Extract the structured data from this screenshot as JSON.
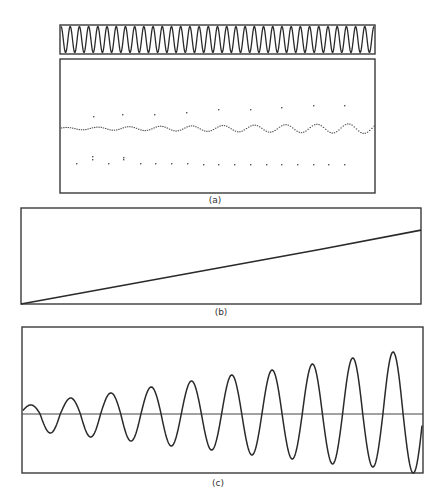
{
  "figure": {
    "panels": [
      {
        "id": "a",
        "label": "(a)"
      },
      {
        "id": "b",
        "label": "(b)"
      },
      {
        "id": "c",
        "label": "(c)"
      }
    ]
  },
  "colors": {
    "background": "#ffffff",
    "ink": "#2a2a2a",
    "frame": "#3a3a3a"
  },
  "chart_data": [
    {
      "panel": "(a) top strip",
      "type": "line",
      "title": "",
      "xlabel": "",
      "ylabel": "",
      "description": "Dense constant-amplitude oscillation filling the strip",
      "cycles": 34,
      "amplitude": "full-scale",
      "grid": false,
      "legend": null
    },
    {
      "panel": "(a) lower",
      "type": "scatter",
      "title": "",
      "xlabel": "",
      "ylabel": "",
      "description": "Dotted waveform near mid-height with slowly growing oscillation, plus sparse sample points above and below",
      "main_trace": {
        "cycles": 10,
        "amplitude_start": 1,
        "amplitude_end": 5,
        "relative_units": "px"
      },
      "upper_points_x": [
        93,
        122,
        154,
        186,
        218,
        250,
        281,
        313,
        344
      ],
      "upper_points_y": [
        116,
        114,
        114,
        112,
        109,
        109,
        107,
        105,
        105
      ],
      "lower_points_x": [
        76,
        92,
        108,
        123,
        140,
        155,
        171,
        187,
        203,
        218,
        234,
        250,
        266,
        281,
        297,
        313,
        328,
        344
      ],
      "lower_points_y": [
        163,
        159,
        163,
        159,
        163,
        163,
        163,
        163,
        164,
        164,
        164,
        164,
        164,
        164,
        164,
        164,
        164,
        164
      ],
      "grid": false,
      "legend": null
    },
    {
      "panel": "(b)",
      "type": "line",
      "title": "",
      "xlabel": "",
      "ylabel": "",
      "description": "Monotonic linear ramp from bottom-left to about 77% height at right",
      "x": [
        0,
        0.25,
        0.5,
        0.75,
        1.0
      ],
      "y": [
        0,
        0.19,
        0.38,
        0.57,
        0.77
      ],
      "xlim": [
        0,
        1
      ],
      "ylim": [
        0,
        1
      ],
      "grid": false,
      "legend": null
    },
    {
      "panel": "(c)",
      "type": "line",
      "title": "",
      "xlabel": "",
      "ylabel": "",
      "description": "Sinusoid with linearly growing amplitude about a horizontal zero axis",
      "cycles": 10,
      "peak_x": [
        30,
        70,
        110,
        150,
        190,
        232,
        273,
        312,
        353,
        393
      ],
      "peak_amplitude": [
        9,
        16,
        21,
        27,
        33,
        39,
        44,
        50,
        56,
        62
      ],
      "trough_amplitude": [
        19,
        23,
        27,
        32,
        36,
        41,
        45,
        50,
        53,
        59
      ],
      "ylim": [
        -62,
        62
      ],
      "grid": false,
      "legend": null
    }
  ]
}
